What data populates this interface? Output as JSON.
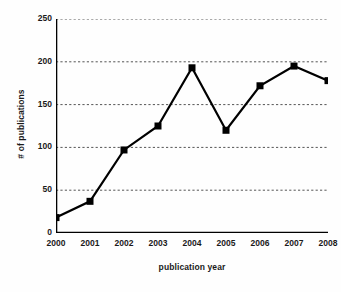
{
  "chart_data": {
    "type": "line",
    "title": "",
    "xlabel": "publication year",
    "ylabel": "# of publications",
    "categories": [
      "2000",
      "2001",
      "2002",
      "2003",
      "2004",
      "2005",
      "2006",
      "2007",
      "2008"
    ],
    "x": [
      2000,
      2001,
      2002,
      2003,
      2004,
      2005,
      2006,
      2007,
      2008
    ],
    "series": [
      {
        "name": "# of publications",
        "values": [
          18,
          37,
          97,
          125,
          193,
          120,
          172,
          195,
          178
        ]
      }
    ],
    "values": [
      18,
      37,
      97,
      125,
      193,
      120,
      172,
      195,
      178
    ],
    "ylim": [
      0,
      250
    ],
    "yticks": [
      0,
      50,
      100,
      150,
      200,
      250
    ],
    "ytick_labels": [
      "0",
      "50",
      "100",
      "150",
      "200",
      "250"
    ],
    "xlim": [
      2000,
      2008
    ],
    "grid": {
      "horizontal": true,
      "vertical": false,
      "style": "dashed",
      "color": "#555555"
    },
    "legend": {
      "visible": false,
      "position": "none"
    },
    "marker": {
      "shape": "square",
      "color": "#000000",
      "size": 7
    },
    "line": {
      "color": "#000000",
      "width": 2.2
    },
    "axis_color": "#000000",
    "background_color": "#ffffff"
  }
}
